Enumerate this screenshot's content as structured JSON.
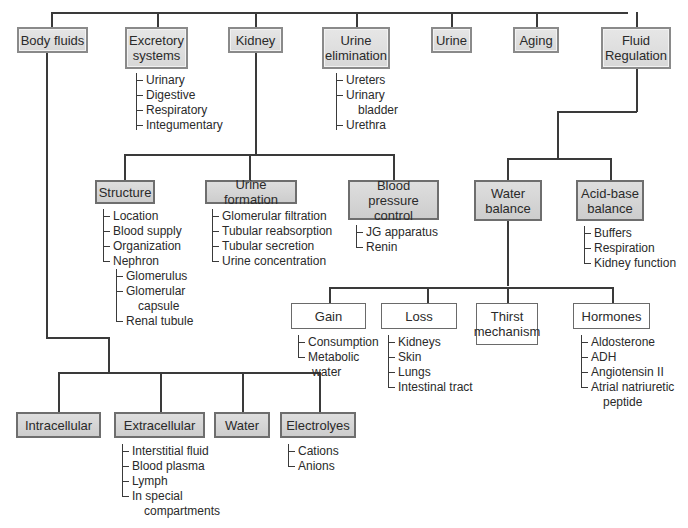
{
  "diagram": {
    "type": "concept-map",
    "top_level": [
      {
        "id": "body_fluids",
        "label": "Body fluids"
      },
      {
        "id": "excretory",
        "label": "Excretory\nsystems",
        "items": [
          "Urinary",
          "Digestive",
          "Respiratory",
          "Integumentary"
        ]
      },
      {
        "id": "kidney",
        "label": "Kidney"
      },
      {
        "id": "urine_elim",
        "label": "Urine\nelimination",
        "items": [
          "Ureters",
          "Urinary\n bladder",
          "Urethra"
        ]
      },
      {
        "id": "urine",
        "label": "Urine"
      },
      {
        "id": "aging",
        "label": "Aging"
      },
      {
        "id": "fluid_reg",
        "label": "Fluid\nRegulation"
      }
    ],
    "kidney_children": [
      {
        "label": "Structure",
        "items": [
          "Location",
          "Blood supply",
          "Organization",
          "Nephron"
        ],
        "nephron_items": [
          "Glomerulus",
          "Glomerular\n capsule",
          "Renal tubule"
        ]
      },
      {
        "label": "Urine formation",
        "items": [
          "Glomerular filtration",
          "Tubular reabsorption",
          "Tubular secretion",
          "Urine concentration"
        ]
      },
      {
        "label": "Blood pressure\ncontrol",
        "items": [
          "JG apparatus",
          "Renin"
        ]
      }
    ],
    "fluid_reg_children": [
      {
        "label": "Water\nbalance"
      },
      {
        "label": "Acid-base\nbalance",
        "items": [
          "Buffers",
          "Respiration",
          "Kidney function"
        ]
      }
    ],
    "water_balance_children": [
      {
        "label": "Gain",
        "items": [
          "Consumption",
          "Metabolic\n water"
        ]
      },
      {
        "label": "Loss",
        "items": [
          "Kidneys",
          "Skin",
          "Lungs",
          "Intestinal tract"
        ]
      },
      {
        "label": "Thirst\nmechanism"
      },
      {
        "label": "Hormones",
        "items": [
          "Aldosterone",
          "ADH",
          "Angiotensin II",
          "Atrial natriuretic\n peptide"
        ]
      }
    ],
    "body_fluids_children": [
      {
        "label": "Intracellular"
      },
      {
        "label": "Extracellular",
        "items": [
          "Interstitial fluid",
          "Blood plasma",
          "Lymph",
          "In special\n compartments"
        ]
      },
      {
        "label": "Water"
      },
      {
        "label": "Electrolyes",
        "items": [
          "Cations",
          "Anions"
        ]
      }
    ]
  },
  "labels": {
    "body_fluids": "Body fluids",
    "excretory_1": "Excretory",
    "excretory_2": "systems",
    "kidney": "Kidney",
    "urine_elim_1": "Urine",
    "urine_elim_2": "elimination",
    "urine": "Urine",
    "aging": "Aging",
    "fluid_reg_1": "Fluid",
    "fluid_reg_2": "Regulation",
    "exc_items": [
      "Urinary",
      "Digestive",
      "Respiratory",
      "Integumentary"
    ],
    "ue_items": [
      "Ureters",
      "Urinary",
      "bladder",
      "Urethra"
    ],
    "structure": "Structure",
    "urine_formation": "Urine formation",
    "bp_1": "Blood pressure",
    "bp_2": "control",
    "structure_items": [
      "Location",
      "Blood supply",
      "Organization",
      "Nephron"
    ],
    "nephron_items": [
      "Glomerulus",
      "Glomerular",
      "capsule",
      "Renal tubule"
    ],
    "uf_items": [
      "Glomerular filtration",
      "Tubular reabsorption",
      "Tubular secretion",
      "Urine concentration"
    ],
    "bp_items": [
      "JG apparatus",
      "Renin"
    ],
    "water_bal_1": "Water",
    "water_bal_2": "balance",
    "acid_1": "Acid-base",
    "acid_2": "balance",
    "acid_items": [
      "Buffers",
      "Respiration",
      "Kidney function"
    ],
    "gain": "Gain",
    "loss": "Loss",
    "thirst_1": "Thirst",
    "thirst_2": "mechanism",
    "hormones": "Hormones",
    "gain_items": [
      "Consumption",
      "Metabolic",
      "water"
    ],
    "loss_items": [
      "Kidneys",
      "Skin",
      "Lungs",
      "Intestinal tract"
    ],
    "hormone_items": [
      "Aldosterone",
      "ADH",
      "Angiotensin II",
      "Atrial natriuretic",
      "peptide"
    ],
    "intracellular": "Intracellular",
    "extracellular": "Extracellular",
    "water": "Water",
    "electrolytes": "Electrolyes",
    "extra_items": [
      "Interstitial fluid",
      "Blood plasma",
      "Lymph",
      "In special",
      "compartments"
    ],
    "electro_items": [
      "Cations",
      "Anions"
    ]
  }
}
